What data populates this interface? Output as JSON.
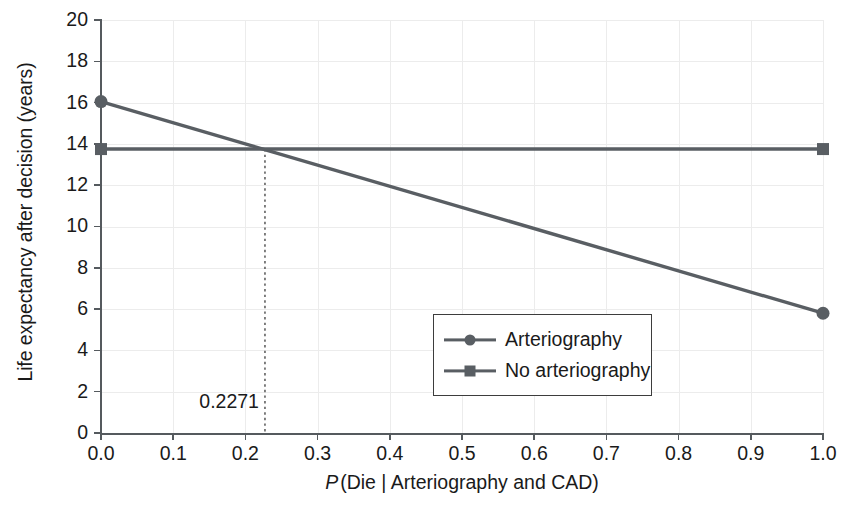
{
  "chart_data": {
    "type": "line",
    "title": "",
    "xlabel": "P (Die | Arteriography and CAD)",
    "xlabel_italic_prefix": "P",
    "xlabel_rest": "(Die | Arteriography and CAD)",
    "ylabel": "Life expectancy after decision (years)",
    "xlim": [
      0.0,
      1.0
    ],
    "ylim": [
      0,
      20
    ],
    "xticks": [
      "0.0",
      "0.1",
      "0.2",
      "0.3",
      "0.4",
      "0.5",
      "0.6",
      "0.7",
      "0.8",
      "0.9",
      "1.0"
    ],
    "xtick_values": [
      0.0,
      0.1,
      0.2,
      0.3,
      0.4,
      0.5,
      0.6,
      0.7,
      0.8,
      0.9,
      1.0
    ],
    "yticks": [
      "0",
      "2",
      "4",
      "6",
      "8",
      "10",
      "12",
      "14",
      "16",
      "18",
      "20"
    ],
    "ytick_values": [
      0,
      2,
      4,
      6,
      8,
      10,
      12,
      14,
      16,
      18,
      20
    ],
    "grid": true,
    "legend_position": "lower right",
    "series": [
      {
        "name": "Arteriography",
        "marker": "circle",
        "color": "#595e63",
        "x": [
          0.0,
          1.0
        ],
        "values": [
          16.05,
          5.8
        ]
      },
      {
        "name": "No arteriography",
        "marker": "square",
        "color": "#595e63",
        "x": [
          0.0,
          1.0
        ],
        "values": [
          13.75,
          13.75
        ]
      }
    ],
    "annotations": [
      {
        "label": "0.2271",
        "type": "threshold-vline",
        "x": 0.2271,
        "y_top": 13.75,
        "y_bottom": 0,
        "style": "dotted"
      }
    ]
  },
  "legend": {
    "items": [
      {
        "label": "Arteriography",
        "marker": "circle"
      },
      {
        "label": "No arteriography",
        "marker": "square"
      }
    ]
  },
  "colors": {
    "series": "#595e63",
    "axis": "#555a5e",
    "grid": "#ececec",
    "text": "#1a1a1a",
    "legend_border": "#3d3d3d",
    "background": "#ffffff"
  }
}
